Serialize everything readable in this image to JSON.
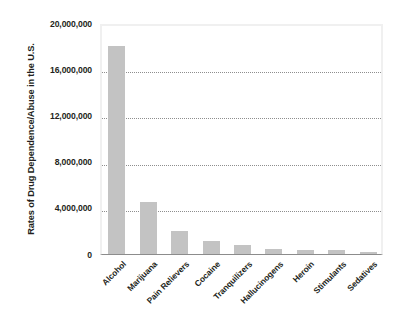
{
  "chart_data": {
    "type": "bar",
    "title": "",
    "xlabel": "",
    "ylabel": "Rates of Drug Dependence/Abuse in the U.S.",
    "categories": [
      "Alcohol",
      "Marijuana",
      "Pain Relievers",
      "Cocaine",
      "Tranquilizers",
      "Hallucinogens",
      "Heroin",
      "Stimulants",
      "Sedatives"
    ],
    "values": [
      18000000,
      4500000,
      2000000,
      1100000,
      800000,
      400000,
      350000,
      350000,
      150000
    ],
    "ylim": [
      0,
      20000000
    ],
    "ytick_values": [
      0,
      4000000,
      8000000,
      12000000,
      16000000,
      20000000
    ],
    "ytick_labels": [
      "0",
      "4,000,000",
      "8,000,000",
      "12,000,000",
      "16,000,000",
      "20,000,000"
    ],
    "grid": true,
    "grid_axis": "y",
    "grid_style": "dotted",
    "legend": "none",
    "bar_color": "#c3c3c3",
    "grid_color": "#8e8e8e",
    "axis_color": "#8c8c8c",
    "text_color": "#231f20",
    "background_color": "#ffffff",
    "xlabel_rotation": -45
  }
}
